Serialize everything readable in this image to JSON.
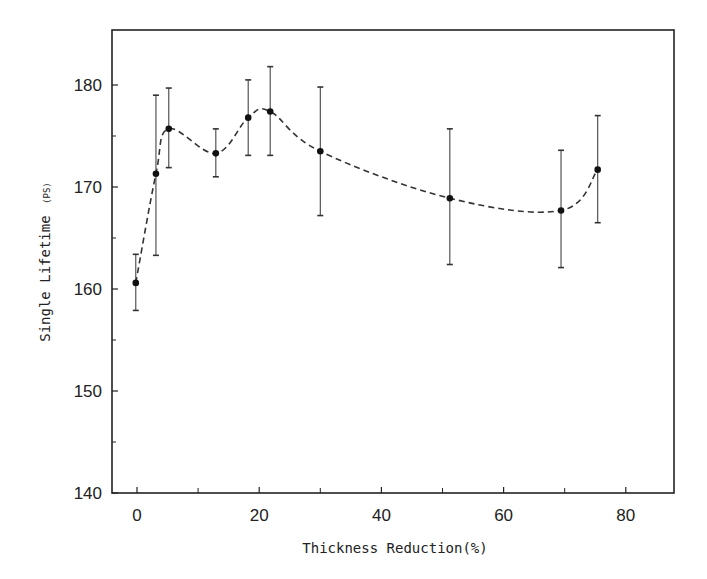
{
  "chart_data": {
    "type": "line",
    "title": "",
    "xlabel": "Thickness Reduction(%)",
    "ylabel": "Single Lifetime",
    "ylabel_unit": "(PS)",
    "xlim": [
      -4,
      88
    ],
    "ylim": [
      140,
      185
    ],
    "x_ticks": [
      0,
      20,
      40,
      60,
      80
    ],
    "x_minor_ticks": [
      10,
      30,
      50,
      70
    ],
    "y_ticks": [
      140,
      150,
      160,
      170,
      180
    ],
    "y_minor_ticks": [
      145,
      155,
      165,
      175
    ],
    "grid": false,
    "legend": null,
    "line_style": "dashed smooth curve with error bars",
    "series": [
      {
        "name": "Single Lifetime",
        "x": [
          -0.2,
          3.1,
          5.2,
          12.9,
          18.2,
          21.8,
          30.0,
          51.2,
          69.4,
          75.4
        ],
        "y": [
          160.6,
          171.3,
          175.7,
          173.3,
          176.8,
          177.4,
          173.5,
          168.9,
          167.7,
          171.7
        ],
        "y_err_upper": [
          163.4,
          179.0,
          179.7,
          175.7,
          180.5,
          181.8,
          179.8,
          175.7,
          173.6,
          177.0
        ],
        "y_err_lower": [
          157.9,
          163.3,
          171.9,
          171.0,
          173.1,
          173.1,
          167.2,
          162.4,
          162.1,
          166.5
        ]
      }
    ]
  },
  "labels": {
    "xlabel": "Thickness Reduction(%)",
    "ylabel_main": "Single Lifetime",
    "ylabel_unit": "(PS)",
    "x_tick_labels": [
      "0",
      "20",
      "40",
      "60",
      "80"
    ],
    "y_tick_labels": [
      "140",
      "150",
      "160",
      "170",
      "180"
    ]
  }
}
